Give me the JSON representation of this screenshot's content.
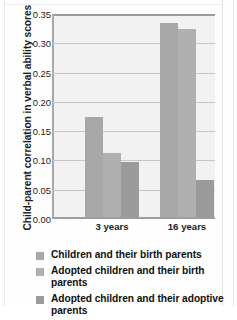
{
  "chart_data": {
    "type": "bar",
    "title": "",
    "subtitle": "",
    "xlabel": "",
    "ylabel": "Child-parent correlation in verbal ability scores",
    "categories": [
      "3 years",
      "16 years"
    ],
    "series": [
      {
        "name": "Children and their birth parents",
        "color": "#a8a8a8",
        "values": [
          0.173,
          0.335
        ]
      },
      {
        "name": "Adopted children and their birth parents",
        "color": "#b0b0b0",
        "values": [
          0.11,
          0.325
        ]
      },
      {
        "name": "Adopted children and their adoptive parents",
        "color": "#9b9b9b",
        "values": [
          0.095,
          0.063
        ]
      }
    ],
    "ylim": [
      0.0,
      0.35
    ],
    "ytick_labels": [
      "0.35",
      "0.30",
      "0.25",
      "0.20",
      "0.15",
      "0.10",
      "0.05",
      "0.00"
    ],
    "ytick_values": [
      0.35,
      0.3,
      0.25,
      0.2,
      0.15,
      0.1,
      0.05,
      0.0
    ],
    "grid": true,
    "legend_position": "bottom",
    "plot_background": "#f2f2f2",
    "gridline_color": "#c6c6c6",
    "axis_color": "#9a9a9a"
  },
  "legend": {
    "items": [
      {
        "label": "Children and their birth parents",
        "color": "#a8a8a8"
      },
      {
        "label": "Adopted children and their birth parents",
        "color": "#b0b0b0"
      },
      {
        "label": "Adopted children and their adoptive parents",
        "color": "#9b9b9b"
      }
    ]
  }
}
